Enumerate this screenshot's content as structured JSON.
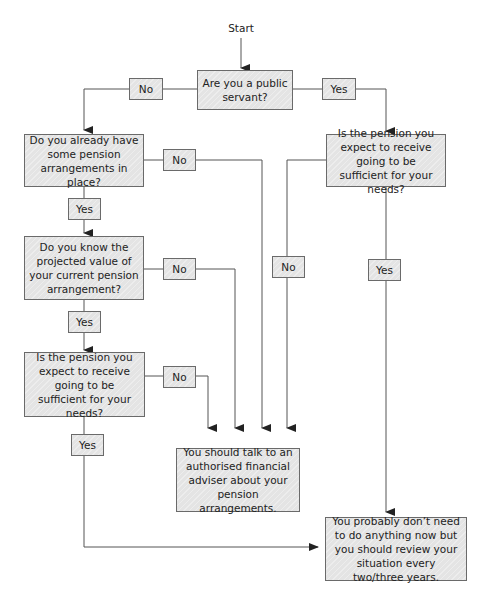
{
  "diagram": {
    "type": "flowchart",
    "start": "Start",
    "colors": {
      "box_fill": "#e4e4e4",
      "box_border": "#6a6a6a",
      "line": "#555555"
    },
    "nodes": {
      "q_public_servant": "Are you a public servant?",
      "q_have_arrangements": "Do you already have some pension arrangements in place?",
      "q_know_projected": "Do you know the projected value of your current pension arrangement?",
      "q_sufficient_left": "Is the pension you expect to receive going to be sufficient for your needs?",
      "q_sufficient_right": "Is the pension you expect to receive going to be sufficient for your needs?",
      "outcome_adviser": "You should talk to an authorised financial adviser about your pension arrangements.",
      "outcome_review": "You probably don’t need to do anything now but you should review your situation every two/three years."
    },
    "edge_labels": {
      "public_no": "No",
      "public_yes": "Yes",
      "have_no": "No",
      "have_yes": "Yes",
      "know_no": "No",
      "know_yes": "Yes",
      "suff_left_no": "No",
      "suff_left_yes": "Yes",
      "suff_right_no": "No",
      "suff_right_yes": "Yes"
    },
    "edges": [
      {
        "from": "start",
        "to": "q_public_servant"
      },
      {
        "from": "q_public_servant",
        "to": "q_have_arrangements",
        "label": "No"
      },
      {
        "from": "q_public_servant",
        "to": "q_sufficient_right",
        "label": "Yes"
      },
      {
        "from": "q_have_arrangements",
        "to": "outcome_adviser",
        "label": "No"
      },
      {
        "from": "q_have_arrangements",
        "to": "q_know_projected",
        "label": "Yes"
      },
      {
        "from": "q_know_projected",
        "to": "outcome_adviser",
        "label": "No"
      },
      {
        "from": "q_know_projected",
        "to": "q_sufficient_left",
        "label": "Yes"
      },
      {
        "from": "q_sufficient_left",
        "to": "outcome_adviser",
        "label": "No"
      },
      {
        "from": "q_sufficient_left",
        "to": "outcome_review",
        "label": "Yes"
      },
      {
        "from": "q_sufficient_right",
        "to": "outcome_adviser",
        "label": "No"
      },
      {
        "from": "q_sufficient_right",
        "to": "outcome_review",
        "label": "Yes"
      }
    ]
  }
}
